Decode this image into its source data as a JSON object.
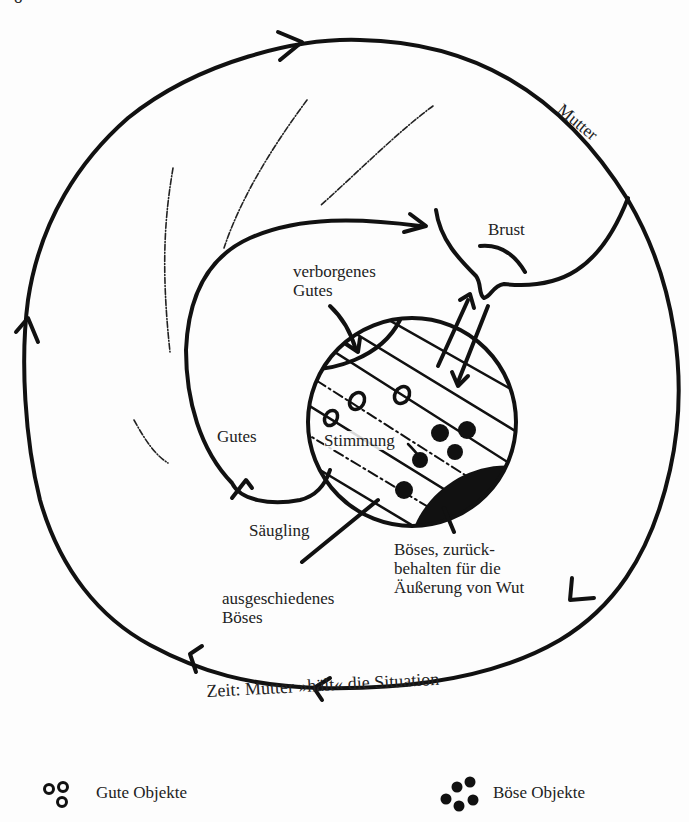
{
  "figure": {
    "top_cropped_text": "o",
    "outer_cycle_label_top": "Mutter",
    "outer_cycle_label_bottom": "Zeit: Mutter »hält« die Situation",
    "labels": {
      "brust": "Brust",
      "verborgenes_gutes_line1": "verborgenes",
      "verborgenes_gutes_line2": "Gutes",
      "gutes": "Gutes",
      "stimmung": "Stimmung",
      "saeugling": "Säugling",
      "boeses_line1": "Böses, zurück-",
      "boeses_line2": "behalten für die",
      "boeses_line3": "Äußerung von Wut",
      "ausgeschieden_line1": "ausgeschiedenes",
      "ausgeschieden_line2": "Böses"
    },
    "colors": {
      "ink": "#111111",
      "paper": "#fdfdfd"
    }
  },
  "legend": {
    "good_objects": {
      "icon": "hollow-rings-icon",
      "label": "Gute Objekte"
    },
    "bad_objects": {
      "icon": "filled-dots-icon",
      "label": "Böse Objekte"
    }
  }
}
